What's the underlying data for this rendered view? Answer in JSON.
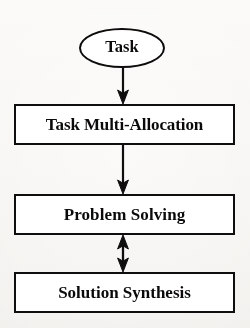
{
  "diagram": {
    "background_color": "#f7f6f4",
    "ink_color": "#121212",
    "nodes": [
      {
        "id": "task",
        "label": "Task",
        "shape": "ellipse",
        "order": 1
      },
      {
        "id": "task-multi-allocation",
        "label": "Task Multi-Allocation",
        "shape": "rectangle",
        "order": 2
      },
      {
        "id": "problem-solving",
        "label": "Problem Solving",
        "shape": "rectangle",
        "order": 3
      },
      {
        "id": "solution-synthesis",
        "label": "Solution Synthesis",
        "shape": "rectangle",
        "order": 4
      }
    ],
    "edges": [
      {
        "id": "task-to-allocation",
        "from": "task",
        "to": "task-multi-allocation",
        "direction": "down",
        "arrowheads": "single"
      },
      {
        "id": "allocation-to-solving",
        "from": "task-multi-allocation",
        "to": "problem-solving",
        "direction": "down",
        "arrowheads": "single"
      },
      {
        "id": "solving-to-synthesis",
        "from": "problem-solving",
        "to": "solution-synthesis",
        "direction": "bidirectional",
        "arrowheads": "double"
      }
    ]
  }
}
